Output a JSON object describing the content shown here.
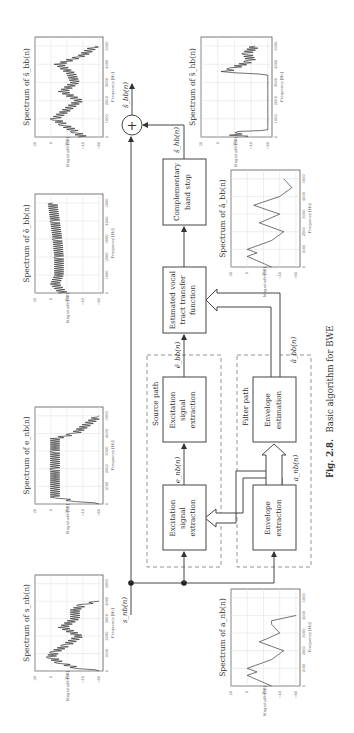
{
  "figure": {
    "caption_number": "Fig. 2.8.",
    "caption_text": "Basic algorithm for BWE",
    "orientation": "rotated 90° counterclockwise (landscape figure on portrait page)"
  },
  "blocks": {
    "excitation_extraction": [
      "Excitation",
      "signal",
      "extraction"
    ],
    "excitation_extraction_2": [
      "Excitation",
      "signal",
      "extraction"
    ],
    "envelope_extraction": [
      "Envelope",
      "extraction"
    ],
    "envelope_estimation": [
      "Envelope",
      "estimation"
    ],
    "vocal_tract": [
      "Estimated vocal",
      "tract transfer",
      "function"
    ],
    "band_stop": [
      "Complementary",
      "band stop"
    ],
    "summation": "+"
  },
  "groups": {
    "source_path": "Source path",
    "filter_path": "Filter path"
  },
  "signals": {
    "input": "s_nb(n)",
    "e_nb": "e_nb(n)",
    "a_nb": "a_nb(n)",
    "e_tilde_bb": "ẽ_bb(n)",
    "a_hat_bb": "â_bb(n)",
    "s_tilde_hb": "s̃_hb(n)",
    "output": "ŝ_bb(n)"
  },
  "plots": {
    "s_nb": {
      "title": "Spectrum of s_nb(n)"
    },
    "e_nb": {
      "title": "Spectrum of e_nb(n)"
    },
    "e_bb": {
      "title": "Spectrum of ẽ_bb(n)"
    },
    "s_bb": {
      "title": "Spectrum of ŝ_bb(n)"
    },
    "a_nb": {
      "title": "Spectrum of a_nb(n)"
    },
    "a_bb": {
      "title": "Spectrum of â_bb(n)"
    },
    "s_hb": {
      "title": "Spectrum of s̃_hb(n)"
    }
  },
  "axes": {
    "xlabel": "Frequency [Hz]",
    "ylabel": "Magnitude [dB]",
    "xticks": [
      "0",
      "1000",
      "2000",
      "3000",
      "4000",
      "5000"
    ],
    "yticks": [
      "20",
      "0",
      "−20",
      "−40",
      "−60"
    ]
  },
  "chart_data": [
    {
      "type": "line",
      "title": "Spectrum of s_nb(n)",
      "xlabel": "Frequency [Hz]",
      "ylabel": "Magnitude [dB]",
      "xlim": [
        0,
        5500
      ],
      "ylim": [
        -65,
        20
      ],
      "x": [
        0,
        200,
        500,
        800,
        1100,
        1500,
        2000,
        2500,
        3000,
        3500,
        3800,
        4000
      ],
      "values": [
        -60,
        -30,
        -10,
        0,
        -5,
        -20,
        -35,
        -15,
        -30,
        -30,
        -40,
        -60
      ]
    },
    {
      "type": "line",
      "title": "Spectrum of e_nb(n)",
      "xlabel": "Frequency [Hz]",
      "ylabel": "Magnitude [dB]",
      "xlim": [
        0,
        5500
      ],
      "ylim": [
        -65,
        20
      ],
      "x": [
        0,
        200,
        400,
        1000,
        2000,
        3000,
        3700,
        4000,
        4500,
        5000
      ],
      "values": [
        -60,
        -25,
        -5,
        -5,
        -5,
        -5,
        -5,
        -30,
        -45,
        -60
      ]
    },
    {
      "type": "line",
      "title": "Spectrum of ẽ_bb(n)",
      "xlabel": "Frequency [Hz]",
      "ylabel": "Magnitude [dB]",
      "xlim": [
        0,
        5500
      ],
      "ylim": [
        -65,
        20
      ],
      "x": [
        0,
        500,
        1000,
        2000,
        3000,
        4000,
        5000
      ],
      "values": [
        -15,
        -5,
        -10,
        -10,
        -8,
        -5,
        -2
      ]
    },
    {
      "type": "line",
      "title": "Spectrum of ŝ_bb(n)",
      "xlabel": "Frequency [Hz]",
      "ylabel": "Magnitude [dB]",
      "xlim": [
        0,
        5500
      ],
      "ylim": [
        -65,
        20
      ],
      "x": [
        0,
        300,
        700,
        1000,
        1500,
        2000,
        2500,
        3000,
        3500,
        4000,
        4500,
        5000
      ],
      "values": [
        -40,
        -30,
        -15,
        -5,
        -20,
        -35,
        -15,
        -30,
        -25,
        -10,
        -40,
        -55
      ]
    },
    {
      "type": "line",
      "title": "Spectrum of a_nb(n)",
      "xlabel": "Frequency [Hz]",
      "ylabel": "Magnitude [dB]",
      "xlim": [
        0,
        5500
      ],
      "ylim": [
        -65,
        20
      ],
      "x": [
        0,
        300,
        600,
        800,
        1000,
        1500,
        2000,
        2500,
        3000,
        3500,
        3700,
        4000
      ],
      "values": [
        -30,
        -15,
        0,
        -12,
        0,
        -30,
        -45,
        -15,
        -40,
        -30,
        -30,
        -60
      ]
    },
    {
      "type": "line",
      "title": "Spectrum of â_bb(n)",
      "xlabel": "Frequency [Hz]",
      "ylabel": "Magnitude [dB]",
      "xlim": [
        0,
        5500
      ],
      "ylim": [
        -65,
        20
      ],
      "x": [
        0,
        300,
        600,
        800,
        1000,
        1500,
        2000,
        2500,
        3000,
        3500,
        4000,
        4500,
        5000
      ],
      "values": [
        -30,
        -15,
        0,
        -12,
        0,
        -30,
        -45,
        -15,
        -40,
        -8,
        -40,
        -55,
        -45
      ]
    },
    {
      "type": "line",
      "title": "Spectrum of s̃_hb(n)",
      "xlabel": "Frequency [Hz]",
      "ylabel": "Magnitude [dB]",
      "xlim": [
        0,
        5500
      ],
      "ylim": [
        -65,
        20
      ],
      "x": [
        0,
        100,
        300,
        400,
        3400,
        3600,
        3800,
        4200,
        4600,
        5000
      ],
      "values": [
        -40,
        -20,
        -30,
        -60,
        -60,
        -10,
        -20,
        -40,
        -35,
        -45
      ]
    }
  ]
}
